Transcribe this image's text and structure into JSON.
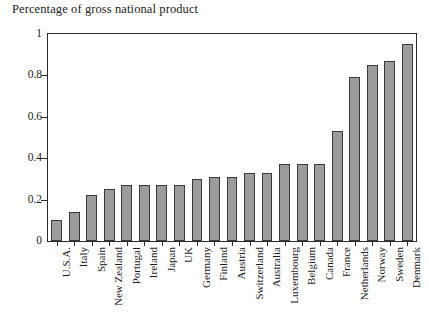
{
  "chart_data": {
    "type": "bar",
    "title": "Percentage of gross national product",
    "xlabel": "",
    "ylabel": "",
    "ylim": [
      0,
      1
    ],
    "ytick_values": [
      0,
      0.2,
      0.4,
      0.6,
      0.8,
      1
    ],
    "ytick_labels": [
      "0",
      "0.2",
      "0.4",
      "0.6",
      "0.8",
      "1"
    ],
    "grid": false,
    "legend": null,
    "bar_color": "#9c9c9c",
    "bar_edge_color": "#3a3a3a",
    "categories": [
      "U.S.A.",
      "Italy",
      "Spain",
      "New Zealand",
      "Portugal",
      "Ireland",
      "Japan",
      "UK",
      "Germany",
      "Finland",
      "Austria",
      "Switzerland",
      "Australia",
      "Luxembourg",
      "Belgium",
      "Canada",
      "France",
      "Netherlands",
      "Norway",
      "Sweden",
      "Denmark"
    ],
    "values": [
      0.1,
      0.14,
      0.22,
      0.25,
      0.27,
      0.27,
      0.27,
      0.27,
      0.3,
      0.31,
      0.31,
      0.33,
      0.33,
      0.37,
      0.37,
      0.37,
      0.53,
      0.79,
      0.85,
      0.87,
      0.95
    ]
  }
}
